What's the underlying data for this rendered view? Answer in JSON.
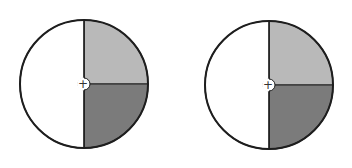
{
  "chart_data": [
    {
      "type": "pie",
      "title": "",
      "categories": [
        "left half (white)",
        "upper-right quarter (light gray)",
        "lower-right quarter (dark gray)"
      ],
      "values": [
        50,
        25,
        25
      ],
      "colors": [
        "#ffffff",
        "#b9b9b9",
        "#7b7b7b"
      ],
      "center_marker": "+"
    },
    {
      "type": "pie",
      "title": "",
      "categories": [
        "left half (white)",
        "upper-right quarter (light gray)",
        "lower-right quarter (dark gray)"
      ],
      "values": [
        50,
        25,
        25
      ],
      "colors": [
        "#ffffff",
        "#b9b9b9",
        "#7b7b7b"
      ],
      "center_marker": "+"
    }
  ],
  "diagrams": [
    {
      "cx": 84,
      "cy": 84,
      "r": 64
    },
    {
      "cx": 269,
      "cy": 85,
      "r": 64
    }
  ],
  "style": {
    "outline": "#1e1e1e",
    "white": "#ffffff",
    "light_gray": "#b9b9b9",
    "dark_gray": "#7b7b7b"
  }
}
